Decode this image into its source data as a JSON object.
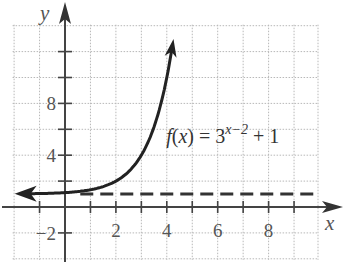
{
  "chart_data": {
    "type": "line",
    "title": "",
    "xlabel": "x",
    "ylabel": "y",
    "xlim": [
      -2,
      10
    ],
    "ylim": [
      -4,
      14
    ],
    "grid": true,
    "x_ticks": [
      -1,
      1,
      2,
      3,
      4,
      5,
      6,
      7,
      8,
      9
    ],
    "x_tick_labels": [
      {
        "value": 2,
        "label": "2"
      },
      {
        "value": 4,
        "label": "4"
      },
      {
        "value": 6,
        "label": "6"
      },
      {
        "value": 8,
        "label": "8"
      }
    ],
    "y_ticks": [
      -2,
      2,
      4,
      6,
      8,
      10,
      12
    ],
    "y_tick_labels": [
      {
        "value": -2,
        "label": "−2"
      },
      {
        "value": 4,
        "label": "4"
      },
      {
        "value": 8,
        "label": "8"
      }
    ],
    "series": [
      {
        "name": "f(x) = 3^(x−2) + 1",
        "style": "solid",
        "arrows": "both",
        "x": [
          -1.9,
          -1,
          0,
          1,
          2,
          2.5,
          3,
          3.5,
          4,
          4.2
        ],
        "y": [
          1.04,
          1.04,
          1.11,
          1.33,
          2,
          2.73,
          4,
          6.2,
          10,
          12.2
        ]
      },
      {
        "name": "asymptote y = 1",
        "style": "dashed",
        "x": [
          0.6,
          10
        ],
        "y": [
          1,
          1
        ]
      }
    ],
    "annotations": [
      {
        "text_main": "f(x) = 3",
        "text_sup": "x−2",
        "text_tail": " + 1",
        "x": 5.55,
        "y": 7.2
      }
    ]
  }
}
